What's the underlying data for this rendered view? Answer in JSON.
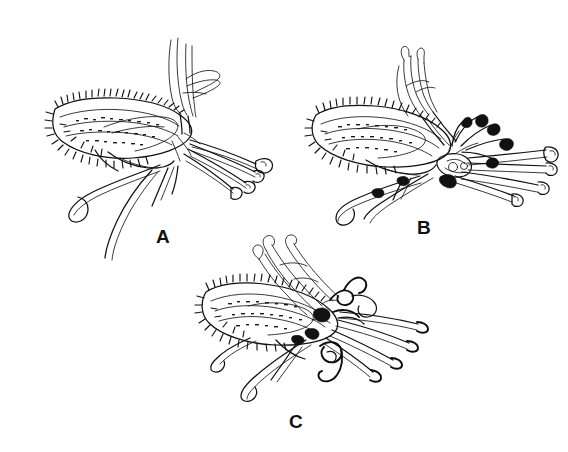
{
  "figure": {
    "kind": "botanical-line-drawing",
    "background_color": "#ffffff",
    "ink_color": "#111111",
    "view": "lateral view of flowers",
    "panel_count": 3
  },
  "panels": [
    {
      "id": "A",
      "label": "A",
      "label_x": 163,
      "label_y": 243,
      "flower_center_x": 150,
      "flower_center_y": 128,
      "description": "flower in lateral view with bristly hairy ovary-calyx at left, slender erect upper petals, and long tubular corolla lobes extending to lower right",
      "features": [
        "hairy-ovary",
        "erect-upper-petals",
        "tubular-corolla-lobes",
        "drooping-lower-petals"
      ]
    },
    {
      "id": "B",
      "label": "B",
      "label_x": 424,
      "label_y": 234,
      "flower_center_x": 420,
      "flower_center_y": 140,
      "description": "flower in lateral view with bristly hairy ovary-calyx at left, dark filled anthers on curved filaments at the throat, and tubular corolla lobes extending right",
      "features": [
        "hairy-ovary",
        "dark-anthers",
        "curved-filaments",
        "tubular-corolla-lobes"
      ]
    },
    {
      "id": "C",
      "label": "C",
      "label_x": 296,
      "label_y": 428,
      "flower_center_x": 320,
      "flower_center_y": 318,
      "description": "flower in lateral view with bristly hairy ovary-calyx at left, coiled hook-shaped style and stamens at the throat, and slender tapering lobes extending right",
      "features": [
        "hairy-ovary",
        "coiled-style",
        "hook-shaped-stamens",
        "slender-lobes"
      ]
    }
  ]
}
